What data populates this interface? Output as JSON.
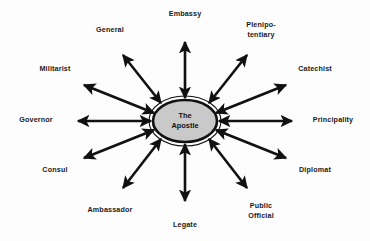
{
  "diagram": {
    "type": "radial-hub-and-spoke",
    "background_color": "#fdfdfd",
    "arrow_color": "#111111",
    "hub": {
      "label": "The\nApostle",
      "fill_color": "#c9c9c9",
      "stroke_color": "#111111",
      "center_x": 185,
      "center_y": 121,
      "radius_x": 32,
      "radius_y": 21
    },
    "spokes": [
      {
        "id": "embassy",
        "label": "Embassy",
        "angle_deg": 90,
        "label_x": 185,
        "label_y": 14,
        "arrow_start_x": 185,
        "arrow_start_y": 98,
        "arrow_end_x": 185,
        "arrow_end_y": 42,
        "double_headed": true
      },
      {
        "id": "plenipotentiary",
        "label": "Plenipo-\ntentiary",
        "angle_deg": 60,
        "label_x": 261,
        "label_y": 29,
        "arrow_start_x": 209,
        "arrow_start_y": 103,
        "arrow_end_x": 247,
        "arrow_end_y": 55,
        "double_headed": true
      },
      {
        "id": "catechist",
        "label": "Catechist",
        "angle_deg": 30,
        "label_x": 315,
        "label_y": 69,
        "arrow_start_x": 216,
        "arrow_start_y": 113,
        "arrow_end_x": 286,
        "arrow_end_y": 85,
        "double_headed": true
      },
      {
        "id": "principality",
        "label": "Principality",
        "angle_deg": 0,
        "label_x": 333,
        "label_y": 120,
        "arrow_start_x": 219,
        "arrow_start_y": 121,
        "arrow_end_x": 292,
        "arrow_end_y": 121,
        "double_headed": true
      },
      {
        "id": "diplomat",
        "label": "Diplomat",
        "angle_deg": 330,
        "label_x": 315,
        "label_y": 170,
        "arrow_start_x": 216,
        "arrow_start_y": 130,
        "arrow_end_x": 286,
        "arrow_end_y": 158,
        "double_headed": true
      },
      {
        "id": "public-official",
        "label": "Public\nOfficial",
        "angle_deg": 300,
        "label_x": 261,
        "label_y": 210,
        "arrow_start_x": 209,
        "arrow_start_y": 139,
        "arrow_end_x": 247,
        "arrow_end_y": 188,
        "double_headed": true
      },
      {
        "id": "legate",
        "label": "Legate",
        "angle_deg": 270,
        "label_x": 185,
        "label_y": 225,
        "arrow_start_x": 185,
        "arrow_start_y": 144,
        "arrow_end_x": 185,
        "arrow_end_y": 201,
        "double_headed": true
      },
      {
        "id": "ambassador",
        "label": "Ambassador",
        "angle_deg": 240,
        "label_x": 110,
        "label_y": 210,
        "arrow_start_x": 161,
        "arrow_start_y": 139,
        "arrow_end_x": 123,
        "arrow_end_y": 188,
        "double_headed": true
      },
      {
        "id": "consul",
        "label": "Consul",
        "angle_deg": 210,
        "label_x": 55,
        "label_y": 170,
        "arrow_start_x": 154,
        "arrow_start_y": 130,
        "arrow_end_x": 84,
        "arrow_end_y": 158,
        "double_headed": true
      },
      {
        "id": "governor",
        "label": "Governor",
        "angle_deg": 180,
        "label_x": 36,
        "label_y": 120,
        "arrow_start_x": 151,
        "arrow_start_y": 121,
        "arrow_end_x": 78,
        "arrow_end_y": 121,
        "double_headed": true
      },
      {
        "id": "militarist",
        "label": "Militarist",
        "angle_deg": 150,
        "label_x": 55,
        "label_y": 69,
        "arrow_start_x": 154,
        "arrow_start_y": 113,
        "arrow_end_x": 84,
        "arrow_end_y": 85,
        "double_headed": true
      },
      {
        "id": "general",
        "label": "General",
        "angle_deg": 120,
        "label_x": 110,
        "label_y": 30,
        "arrow_start_x": 161,
        "arrow_start_y": 103,
        "arrow_end_x": 123,
        "arrow_end_y": 55,
        "double_headed": true
      }
    ]
  }
}
